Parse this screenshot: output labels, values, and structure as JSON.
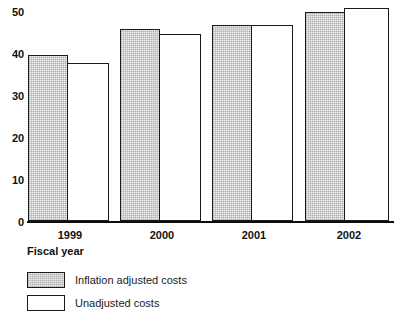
{
  "chart_data": {
    "type": "bar",
    "title": "",
    "subtitle": "",
    "xlabel": "Fiscal year",
    "ylabel": "",
    "categories": [
      "1999",
      "2000",
      "2001",
      "2002"
    ],
    "series": [
      {
        "name": "Inflation adjusted costs",
        "values": [
          39,
          45,
          46,
          49
        ],
        "fill": "#eeeeee",
        "pattern": "stipple"
      },
      {
        "name": "Unadjusted costs",
        "values": [
          37,
          44,
          46,
          50
        ],
        "fill": "#ffffff",
        "pattern": "solid"
      }
    ],
    "ylim": [
      0,
      50
    ],
    "yticks": [
      0,
      10,
      20,
      30,
      40,
      50
    ],
    "ytick_labels": [
      "0",
      "10",
      "20",
      "30",
      "40",
      "50"
    ],
    "grid": false,
    "legend_position": "below-left",
    "axis_color": "#1a1a1a"
  },
  "axis": {
    "y_labels": [
      "50",
      "40",
      "30",
      "20",
      "10",
      "0"
    ],
    "x_labels": [
      "1999",
      "2000",
      "2001",
      "2002"
    ],
    "x_title": "Fiscal year"
  },
  "legend": {
    "entries": [
      {
        "label": "Inflation adjusted costs"
      },
      {
        "label": "Unadjusted costs"
      }
    ]
  }
}
